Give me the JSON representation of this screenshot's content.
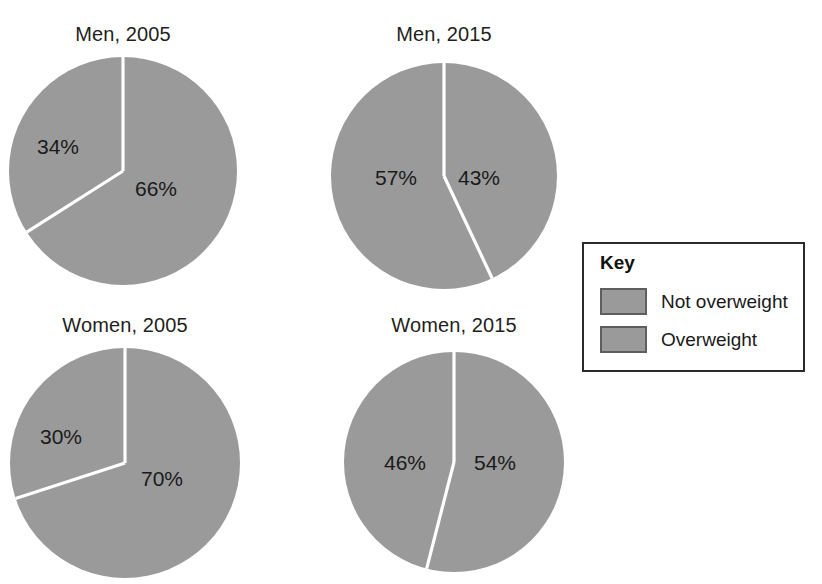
{
  "chart_data": {
    "type": "pie",
    "title": "",
    "legend_position": "right",
    "legend_title": "Key",
    "categories": [
      "Not overweight",
      "Overweight"
    ],
    "colors": {
      "not_overweight": "#9a9a9a",
      "overweight": "#9a9a9a",
      "slice_divider": "#ffffff",
      "text": "#1a1a1a",
      "key_border": "#2b2b2b",
      "swatch_border": "#5e5e5e"
    },
    "charts": [
      {
        "title": "Men, 2005",
        "slices": [
          {
            "category": "Overweight",
            "value": 66,
            "label": "66%"
          },
          {
            "category": "Not overweight",
            "value": 34,
            "label": "34%"
          }
        ]
      },
      {
        "title": "Men, 2015",
        "slices": [
          {
            "category": "Overweight",
            "value": 43,
            "label": "43%"
          },
          {
            "category": "Not overweight",
            "value": 57,
            "label": "57%"
          }
        ]
      },
      {
        "title": "Women, 2005",
        "slices": [
          {
            "category": "Overweight",
            "value": 70,
            "label": "70%"
          },
          {
            "category": "Not overweight",
            "value": 30,
            "label": "30%"
          }
        ]
      },
      {
        "title": "Women, 2015",
        "slices": [
          {
            "category": "Overweight",
            "value": 54,
            "label": "54%"
          },
          {
            "category": "Not overweight",
            "value": 46,
            "label": "46%"
          }
        ]
      }
    ]
  },
  "figure": {
    "pies": [
      {
        "title": "Men, 2005",
        "title_left": 23,
        "title_top": 24,
        "title_width": 200,
        "cx": 123,
        "cy": 171,
        "r": 114,
        "major_value": 66,
        "major_label": "66%",
        "minor_label": "34%",
        "major_label_left": 135,
        "major_label_top": 178,
        "minor_label_left": 37,
        "minor_label_top": 136
      },
      {
        "title": "Men, 2015",
        "title_left": 344,
        "title_top": 24,
        "title_width": 200,
        "cx": 444,
        "cy": 176,
        "r": 113,
        "major_value": 43,
        "major_label": "43%",
        "minor_label": "57%",
        "major_label_left": 458,
        "major_label_top": 167,
        "minor_label_left": 375,
        "minor_label_top": 167
      },
      {
        "title": "Women, 2005",
        "title_left": 25,
        "title_top": 315,
        "title_width": 200,
        "cx": 125,
        "cy": 463,
        "r": 115,
        "major_value": 70,
        "major_label": "70%",
        "minor_label": "30%",
        "major_label_left": 141,
        "major_label_top": 468,
        "minor_label_left": 40,
        "minor_label_top": 426
      },
      {
        "title": "Women, 2015",
        "title_left": 354,
        "title_top": 315,
        "title_width": 200,
        "cx": 454,
        "cy": 462,
        "r": 110,
        "major_value": 54,
        "major_label": "54%",
        "minor_label": "46%",
        "major_label_left": 474,
        "major_label_top": 452,
        "minor_label_left": 384,
        "minor_label_top": 452
      }
    ],
    "key": {
      "left": 582,
      "top": 242,
      "width": 223,
      "height": 130,
      "title": "Key",
      "rows": [
        {
          "label": "Not overweight",
          "top": 44
        },
        {
          "label": "Overweight",
          "top": 82
        }
      ]
    }
  }
}
